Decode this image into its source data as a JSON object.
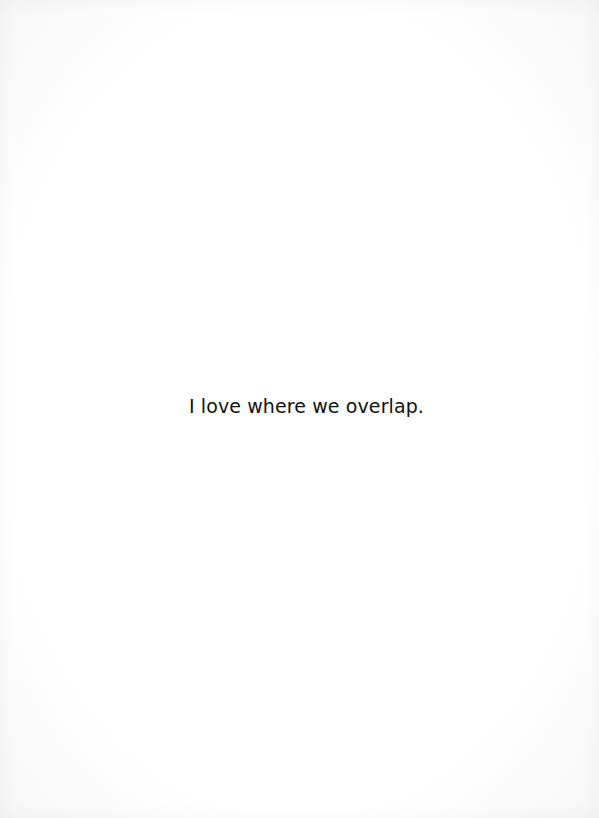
{
  "page": {
    "background_color": "#ffffff",
    "text_color": "#111111",
    "quote": "I love where we overlap."
  }
}
